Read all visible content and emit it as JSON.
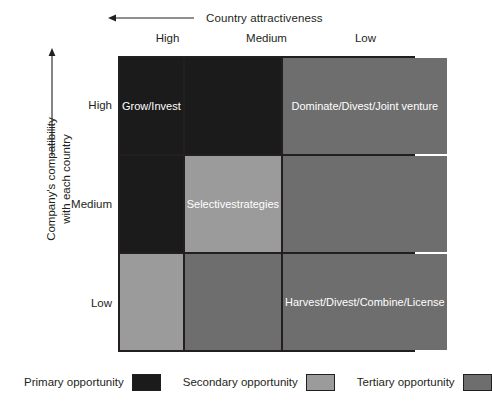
{
  "axes": {
    "top": {
      "label": "Country attractiveness",
      "arrow_direction": "left",
      "categories": [
        "High",
        "Medium",
        "Low"
      ]
    },
    "left": {
      "label_line1": "Company's compatibility",
      "label_line2": "with each country",
      "arrow_direction": "up",
      "categories": [
        "High",
        "Medium",
        "Low"
      ]
    }
  },
  "chart_data": {
    "type": "heatmap",
    "title": "",
    "xlabel": "Country attractiveness",
    "ylabel": "Company's compatibility with each country",
    "categories": [
      "High",
      "Medium",
      "Low"
    ],
    "row_categories": [
      "High",
      "Medium",
      "Low"
    ],
    "legend_position": "bottom",
    "grid": true,
    "cells": [
      {
        "row": "High",
        "col": "High",
        "level": "primary",
        "color": "#1b1b1b",
        "text": "Grow/\nInvest"
      },
      {
        "row": "High",
        "col": "Medium",
        "level": "primary",
        "color": "#1b1b1b",
        "text": ""
      },
      {
        "row": "High",
        "col": "Low",
        "level": "tertiary",
        "color": "#6e6e6e",
        "text": "Dominate/\nDivest/\nJoint venture"
      },
      {
        "row": "Medium",
        "col": "High",
        "level": "primary",
        "color": "#1b1b1b",
        "text": ""
      },
      {
        "row": "Medium",
        "col": "Medium",
        "level": "secondary",
        "color": "#9b9b9b",
        "text": "Selective\nstrategies"
      },
      {
        "row": "Medium",
        "col": "Low",
        "level": "tertiary",
        "color": "#6e6e6e",
        "text": ""
      },
      {
        "row": "Low",
        "col": "High",
        "level": "secondary",
        "color": "#9b9b9b",
        "text": ""
      },
      {
        "row": "Low",
        "col": "Medium",
        "level": "tertiary",
        "color": "#6e6e6e",
        "text": ""
      },
      {
        "row": "Low",
        "col": "Low",
        "level": "tertiary",
        "color": "#6e6e6e",
        "text": "Harvest/\nDivest/\nCombine/\nLicense"
      }
    ]
  },
  "legend": [
    {
      "label": "Primary opportunity",
      "level": "primary",
      "color": "#1b1b1b"
    },
    {
      "label": "Secondary opportunity",
      "level": "secondary",
      "color": "#9b9b9b"
    },
    {
      "label": "Tertiary opportunity",
      "level": "tertiary",
      "color": "#6e6e6e"
    }
  ]
}
